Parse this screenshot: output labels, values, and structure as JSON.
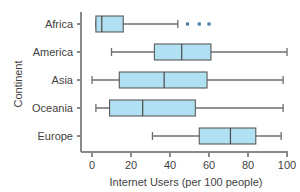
{
  "chart_data": {
    "type": "box",
    "title": "",
    "xlabel": "Internet Users (per 100 people)",
    "ylabel": "Continent",
    "xlim": [
      0,
      100
    ],
    "xticks": [
      0,
      20,
      40,
      60,
      80,
      100
    ],
    "xtick_labels": [
      "0",
      "20",
      "40",
      "60",
      "80",
      "100"
    ],
    "grid": false,
    "legend": "none",
    "orientation": "horizontal",
    "categories": [
      "Africa",
      "America",
      "Asia",
      "Oceania",
      "Europe"
    ],
    "boxes": [
      {
        "category": "Africa",
        "whisker_low": 2,
        "q1": 2,
        "median": 5,
        "q3": 16,
        "whisker_high": 44,
        "outliers": [
          49,
          55,
          60
        ]
      },
      {
        "category": "America",
        "whisker_low": 10,
        "q1": 32,
        "median": 46,
        "q3": 61,
        "whisker_high": 100,
        "outliers": []
      },
      {
        "category": "Asia",
        "whisker_low": 0,
        "q1": 14,
        "median": 37,
        "q3": 59,
        "whisker_high": 98,
        "outliers": []
      },
      {
        "category": "Oceania",
        "whisker_low": 2,
        "q1": 9,
        "median": 26,
        "q3": 53,
        "whisker_high": 98,
        "outliers": []
      },
      {
        "category": "Europe",
        "whisker_low": 31,
        "q1": 55,
        "median": 71,
        "q3": 84,
        "whisker_high": 97,
        "outliers": []
      }
    ],
    "colors": {
      "box_fill": "#b0e0f2",
      "box_stroke": "#5a5a5a",
      "median": "#4a4a4a",
      "whisker": "#6e6e6e",
      "outlier": "#4a7fa8",
      "axis": "#8a8a8a",
      "text": "#3f3f3f",
      "background": "#ffffff"
    }
  }
}
